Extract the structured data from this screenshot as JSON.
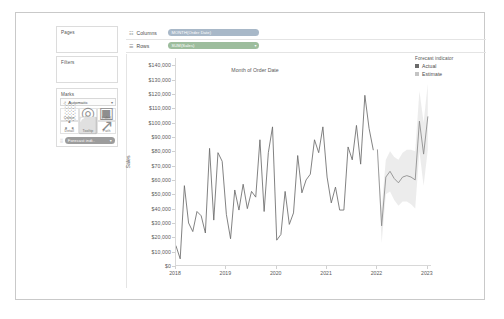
{
  "top_strip": {
    "ghost_text": ""
  },
  "sidebar": {
    "pages": {
      "title": "Pages"
    },
    "filters": {
      "title": "Filters"
    },
    "marks": {
      "title": "Marks",
      "type_icon": "line-mark-icon",
      "type_label": "Automatic",
      "caret": "▾",
      "buttons": [
        {
          "name": "colour",
          "label": "Colour",
          "icon": "░"
        },
        {
          "name": "size",
          "label": "Size",
          "icon": "◎"
        },
        {
          "name": "label",
          "label": "Label",
          "icon": "▣"
        },
        {
          "name": "detail",
          "label": "Detail",
          "icon": "∴"
        },
        {
          "name": "tooltip",
          "label": "Tooltip",
          "icon": "⬜"
        },
        {
          "name": "path",
          "label": "Path",
          "icon": "↗"
        }
      ],
      "pill": {
        "icon": "░",
        "label": "Forecast indi..",
        "remove": "▾"
      }
    }
  },
  "shelves": {
    "columns": {
      "label": "Columns",
      "icon": "☷",
      "pill": {
        "text": "MONTH(Order Date)",
        "remove": ""
      }
    },
    "rows": {
      "label": "Rows",
      "icon": "☰",
      "pill": {
        "text": "SUM(Sales)",
        "remove": "▾"
      }
    }
  },
  "legend": {
    "title": "Forecast indicator",
    "items": [
      {
        "label": "Actual",
        "color": "#6b6b6b"
      },
      {
        "label": "Estimate",
        "color": "#c4c4c4"
      }
    ]
  },
  "chart_data": {
    "type": "line",
    "title": "",
    "xlabel": "Month of Order Date",
    "ylabel": "Sales",
    "ylim": [
      0,
      145000
    ],
    "yticks": [
      0,
      10000,
      20000,
      30000,
      40000,
      50000,
      60000,
      70000,
      80000,
      90000,
      100000,
      110000,
      120000,
      130000,
      140000
    ],
    "ytick_labels": [
      "$0",
      "$10,000",
      "$20,000",
      "$30,000",
      "$40,000",
      "$50,000",
      "$60,000",
      "$70,000",
      "$80,000",
      "$90,000",
      "$100,000",
      "$110,000",
      "$120,000",
      "$130,000",
      "$140,000"
    ],
    "xticks": [
      "2018",
      "2019",
      "2020",
      "2021",
      "2022",
      "2023"
    ],
    "xtick_positions": [
      0,
      12,
      24,
      36,
      48,
      60
    ],
    "grid": false,
    "legend_position": "right",
    "forecast_start_index": 48,
    "series": [
      {
        "name": "Actual",
        "color": "#6b6b6b",
        "x": [
          0,
          1,
          2,
          3,
          4,
          5,
          6,
          7,
          8,
          9,
          10,
          11,
          12,
          13,
          14,
          15,
          16,
          17,
          18,
          19,
          20,
          21,
          22,
          23,
          24,
          25,
          26,
          27,
          28,
          29,
          30,
          31,
          32,
          33,
          34,
          35,
          36,
          37,
          38,
          39,
          40,
          41,
          42,
          43,
          44,
          45,
          46,
          47
        ],
        "values": [
          14000,
          5000,
          56000,
          30000,
          24000,
          38000,
          35000,
          23000,
          82000,
          32000,
          79000,
          73000,
          36000,
          19000,
          53000,
          39000,
          57000,
          40000,
          52000,
          48000,
          88000,
          38000,
          79000,
          97000,
          18000,
          22000,
          52000,
          29000,
          37000,
          77000,
          51000,
          60000,
          64000,
          88000,
          79000,
          97000,
          62000,
          44000,
          55000,
          39000,
          39000,
          83000,
          74000,
          98000,
          71000,
          119000,
          96000,
          81000
        ]
      },
      {
        "name": "Estimate",
        "color": "#8a8a8a",
        "x": [
          48,
          49,
          50,
          51,
          52,
          53,
          54,
          55,
          56,
          57,
          58,
          59,
          60
        ],
        "values": [
          81000,
          28000,
          62000,
          66000,
          61000,
          58000,
          62000,
          63000,
          62000,
          60000,
          101000,
          78000,
          104000
        ],
        "ci_upper": [
          81000,
          40000,
          74000,
          80000,
          76000,
          74000,
          79000,
          81000,
          81000,
          80000,
          122000,
          100000,
          127000
        ],
        "ci_lower": [
          81000,
          16000,
          50000,
          52000,
          46000,
          42000,
          45000,
          45000,
          43000,
          40000,
          80000,
          56000,
          81000
        ]
      }
    ]
  }
}
